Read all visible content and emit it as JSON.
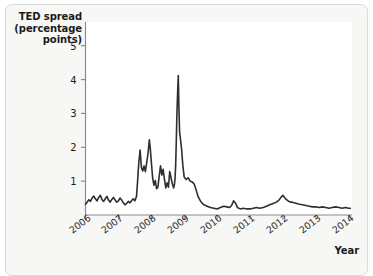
{
  "figure": {
    "background_color": "#f7f7f5",
    "border_color": "#d9d9d6",
    "plot_background": "#ffffff",
    "line_color": "#2e2e2e",
    "axis_color": "#8c8c8c"
  },
  "labels": {
    "y_axis_title": "TED spread\n(percentage\npoints)",
    "x_axis_title": "Year"
  },
  "chart_data": {
    "type": "line",
    "title": "",
    "subtitle": "",
    "xlabel": "Year",
    "ylabel": "TED spread (percentage points)",
    "xlim": [
      2006,
      2014.1
    ],
    "ylim": [
      0,
      5.7
    ],
    "grid": false,
    "legend": null,
    "x_ticks": [
      2006,
      2007,
      2008,
      2009,
      2010,
      2011,
      2012,
      2013,
      2014
    ],
    "x_tick_labels": [
      "2006",
      "2007",
      "2008",
      "2009",
      "2010",
      "2011",
      "2012",
      "2013",
      "2014"
    ],
    "x_tick_rotation": -38,
    "y_ticks": [
      1,
      2,
      3,
      4,
      5
    ],
    "y_tick_labels": [
      "1",
      "2",
      "3",
      "4",
      "5"
    ],
    "series": [
      {
        "name": "TED spread",
        "units": "percentage points",
        "x": [
          2006.0,
          2006.05,
          2006.1,
          2006.15,
          2006.2,
          2006.25,
          2006.3,
          2006.35,
          2006.4,
          2006.45,
          2006.5,
          2006.55,
          2006.6,
          2006.65,
          2006.7,
          2006.75,
          2006.8,
          2006.85,
          2006.9,
          2006.95,
          2007.0,
          2007.05,
          2007.1,
          2007.15,
          2007.2,
          2007.25,
          2007.3,
          2007.35,
          2007.4,
          2007.45,
          2007.5,
          2007.55,
          2007.58,
          2007.62,
          2007.66,
          2007.7,
          2007.74,
          2007.78,
          2007.82,
          2007.86,
          2007.9,
          2007.94,
          2007.97,
          2008.0,
          2008.04,
          2008.08,
          2008.12,
          2008.16,
          2008.2,
          2008.24,
          2008.28,
          2008.32,
          2008.36,
          2008.4,
          2008.44,
          2008.48,
          2008.52,
          2008.56,
          2008.6,
          2008.64,
          2008.68,
          2008.7,
          2008.72,
          2008.74,
          2008.76,
          2008.78,
          2008.8,
          2008.82,
          2008.84,
          2008.86,
          2008.88,
          2008.92,
          2008.96,
          2009.0,
          2009.06,
          2009.12,
          2009.18,
          2009.24,
          2009.3,
          2009.36,
          2009.42,
          2009.5,
          2009.6,
          2009.7,
          2009.8,
          2009.9,
          2010.0,
          2010.1,
          2010.2,
          2010.3,
          2010.38,
          2010.44,
          2010.5,
          2010.56,
          2010.62,
          2010.7,
          2010.8,
          2010.9,
          2011.0,
          2011.1,
          2011.2,
          2011.3,
          2011.4,
          2011.5,
          2011.6,
          2011.7,
          2011.8,
          2011.88,
          2011.94,
          2012.0,
          2012.05,
          2012.1,
          2012.18,
          2012.26,
          2012.34,
          2012.42,
          2012.5,
          2012.6,
          2012.7,
          2012.8,
          2012.9,
          2013.0,
          2013.1,
          2013.2,
          2013.3,
          2013.4,
          2013.5,
          2013.6,
          2013.7,
          2013.8,
          2013.9,
          2014.0,
          2014.05
        ],
        "y": [
          0.32,
          0.38,
          0.45,
          0.4,
          0.5,
          0.56,
          0.48,
          0.42,
          0.52,
          0.58,
          0.46,
          0.4,
          0.48,
          0.55,
          0.44,
          0.38,
          0.46,
          0.52,
          0.44,
          0.38,
          0.42,
          0.5,
          0.44,
          0.36,
          0.3,
          0.34,
          0.4,
          0.36,
          0.42,
          0.48,
          0.42,
          0.55,
          0.95,
          1.55,
          1.92,
          1.4,
          1.3,
          1.45,
          1.28,
          1.55,
          1.82,
          2.22,
          1.95,
          1.58,
          1.1,
          0.88,
          1.02,
          0.78,
          0.82,
          1.15,
          1.45,
          1.18,
          1.35,
          1.05,
          0.8,
          0.95,
          0.82,
          1.28,
          1.1,
          0.92,
          0.8,
          0.88,
          1.05,
          1.45,
          2.2,
          3.05,
          3.6,
          4.12,
          3.15,
          2.45,
          2.3,
          1.95,
          1.45,
          1.12,
          1.05,
          1.1,
          1.0,
          0.98,
          0.92,
          0.75,
          0.55,
          0.4,
          0.3,
          0.26,
          0.22,
          0.2,
          0.18,
          0.22,
          0.26,
          0.24,
          0.22,
          0.28,
          0.42,
          0.35,
          0.22,
          0.18,
          0.2,
          0.18,
          0.18,
          0.2,
          0.22,
          0.2,
          0.22,
          0.26,
          0.3,
          0.34,
          0.38,
          0.44,
          0.52,
          0.58,
          0.52,
          0.46,
          0.4,
          0.38,
          0.36,
          0.34,
          0.32,
          0.3,
          0.28,
          0.26,
          0.24,
          0.24,
          0.22,
          0.24,
          0.22,
          0.2,
          0.22,
          0.24,
          0.22,
          0.2,
          0.22,
          0.2,
          0.2
        ]
      }
    ],
    "annotations": [
      {
        "label": "peak",
        "x": 2008.82,
        "y": 4.12
      }
    ]
  }
}
